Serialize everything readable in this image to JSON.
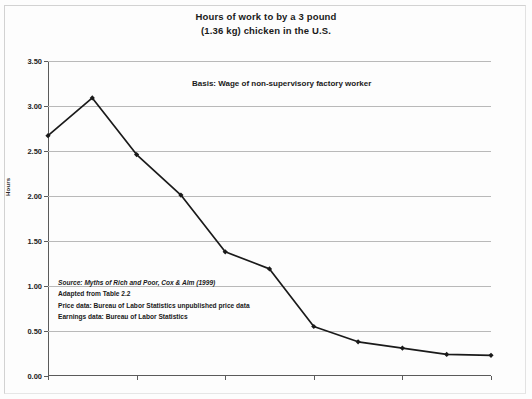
{
  "figure": {
    "title_line1": "Hours of work to by a 3 pound",
    "title_line2": "(1.36 kg) chicken in the U.S.",
    "basis_note": "Basis:  Wage of non-supervisory factory worker",
    "source_lines": [
      "Source: Myths of Rich and Poor, Cox & Alm (1999)",
      "Adapted from Table 2.2",
      "Price data: Bureau of Labor Statistics unpublished price data",
      "Earnings data: Bureau of Labor Statistics"
    ],
    "line_color": "#1a1a1a",
    "grid_color": "#b9b9b9",
    "axis_color": "#5b5b5b",
    "background": "#fdfdfd"
  },
  "chart_data": {
    "type": "line",
    "title": "Hours of work to by a 3 pound (1.36 kg) chicken in the U.S.",
    "xlabel": "",
    "ylabel": "Hours",
    "xlim": [
      1900,
      2000
    ],
    "ylim": [
      0.0,
      3.5
    ],
    "grid": true,
    "legend": false,
    "xticks": [
      "1900",
      "1920",
      "1940",
      "1960",
      "1980",
      "2000"
    ],
    "xtick_values": [
      1900,
      1920,
      1940,
      1960,
      1980,
      2000
    ],
    "yticks": [
      "0.00",
      "0.50",
      "1.00",
      "1.50",
      "2.00",
      "2.50",
      "3.00",
      "3.50"
    ],
    "ytick_values": [
      0.0,
      0.5,
      1.0,
      1.5,
      2.0,
      2.5,
      3.0,
      3.5
    ],
    "x": [
      1900,
      1910,
      1920,
      1930,
      1940,
      1950,
      1960,
      1970,
      1980,
      1990,
      2000
    ],
    "values": [
      2.67,
      3.09,
      2.46,
      2.01,
      1.38,
      1.19,
      0.55,
      0.38,
      0.31,
      0.24,
      0.23
    ],
    "marker": "diamond",
    "annotations": [
      "Basis:  Wage of non-supervisory factory worker",
      "Source: Myths of Rich and Poor, Cox & Alm (1999)",
      "Adapted from Table 2.2",
      "Price data: Bureau of Labor Statistics unpublished price data",
      "Earnings data: Bureau of Labor Statistics"
    ]
  }
}
